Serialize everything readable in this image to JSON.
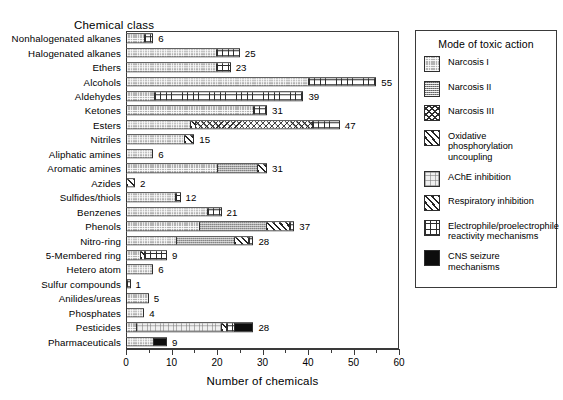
{
  "chart_data": {
    "type": "bar",
    "orientation": "horizontal",
    "stacked": true,
    "title": "",
    "ylabel": "Chemical class",
    "xlabel": "Number of chemicals",
    "xlim": [
      0,
      60
    ],
    "xticks": [
      0,
      10,
      20,
      30,
      40,
      50,
      60
    ],
    "xtick_minor_step": 5,
    "grid": false,
    "legend": {
      "position": "right",
      "title": "Mode of toxic action",
      "entries": [
        {
          "name": "Narcosis I",
          "pattern": "p-narc1"
        },
        {
          "name": "Narcosis II",
          "pattern": "p-narc2"
        },
        {
          "name": "Narcosis III",
          "pattern": "p-narc3"
        },
        {
          "name": "Oxidative phosphorylation uncoupling",
          "pattern": "p-oxphos"
        },
        {
          "name": "AChE inhibition",
          "pattern": "p-ache"
        },
        {
          "name": "Respiratory inhibition",
          "pattern": "p-resp"
        },
        {
          "name": "Electrophile/proelectrophile reactivity mechanisms",
          "pattern": "p-electro"
        },
        {
          "name": "CNS seizure mechanisms",
          "pattern": "p-cns"
        }
      ]
    },
    "series": [
      {
        "name": "Narcosis I",
        "pattern": "p-narc1"
      },
      {
        "name": "Narcosis II",
        "pattern": "p-narc2"
      },
      {
        "name": "Narcosis III",
        "pattern": "p-narc3"
      },
      {
        "name": "Oxidative phosphorylation uncoupling",
        "pattern": "p-oxphos"
      },
      {
        "name": "AChE inhibition",
        "pattern": "p-ache"
      },
      {
        "name": "Respiratory inhibition",
        "pattern": "p-resp"
      },
      {
        "name": "Electrophile/proelectrophile reactivity mechanisms",
        "pattern": "p-electro"
      },
      {
        "name": "CNS seizure mechanisms",
        "pattern": "p-cns"
      }
    ],
    "categories": [
      "Nonhalogenated alkanes",
      "Halogenated alkanes",
      "Ethers",
      "Alcohols",
      "Aldehydes",
      "Ketones",
      "Esters",
      "Nitriles",
      "Aliphatic amines",
      "Aromatic amines",
      "Azides",
      "Sulfides/thiols",
      "Benzenes",
      "Phenols",
      "Nitro-ring",
      "5-Membered ring",
      "Hetero atom",
      "Sulfur compounds",
      "Anilides/ureas",
      "Phosphates",
      "Pesticides",
      "Pharmaceuticals"
    ],
    "bars": [
      {
        "category": "Nonhalogenated alkanes",
        "total": 6,
        "segments": [
          {
            "pattern": "p-narc1",
            "value": 4
          },
          {
            "pattern": "p-electro",
            "value": 2
          }
        ]
      },
      {
        "category": "Halogenated alkanes",
        "total": 25,
        "segments": [
          {
            "pattern": "p-narc1",
            "value": 20
          },
          {
            "pattern": "p-electro",
            "value": 5
          }
        ]
      },
      {
        "category": "Ethers",
        "total": 23,
        "segments": [
          {
            "pattern": "p-narc1",
            "value": 20
          },
          {
            "pattern": "p-electro",
            "value": 3
          }
        ]
      },
      {
        "category": "Alcohols",
        "total": 55,
        "segments": [
          {
            "pattern": "p-narc1",
            "value": 40
          },
          {
            "pattern": "p-electro",
            "value": 15
          }
        ]
      },
      {
        "category": "Aldehydes",
        "total": 39,
        "segments": [
          {
            "pattern": "p-narc1",
            "value": 6
          },
          {
            "pattern": "p-electro",
            "value": 33
          }
        ]
      },
      {
        "category": "Ketones",
        "total": 31,
        "segments": [
          {
            "pattern": "p-narc1",
            "value": 28
          },
          {
            "pattern": "p-electro",
            "value": 3
          }
        ]
      },
      {
        "category": "Esters",
        "total": 47,
        "segments": [
          {
            "pattern": "p-narc1",
            "value": 14
          },
          {
            "pattern": "p-oxphos",
            "value": 1
          },
          {
            "pattern": "p-narc3",
            "value": 26
          },
          {
            "pattern": "p-electro",
            "value": 6
          }
        ]
      },
      {
        "category": "Nitriles",
        "total": 15,
        "segments": [
          {
            "pattern": "p-narc1",
            "value": 13
          },
          {
            "pattern": "p-resp",
            "value": 2
          }
        ]
      },
      {
        "category": "Aliphatic amines",
        "total": 6,
        "segments": [
          {
            "pattern": "p-narc1",
            "value": 6
          }
        ]
      },
      {
        "category": "Aromatic amines",
        "total": 31,
        "segments": [
          {
            "pattern": "p-narc1",
            "value": 20
          },
          {
            "pattern": "p-narc2",
            "value": 9
          },
          {
            "pattern": "p-resp",
            "value": 2
          }
        ]
      },
      {
        "category": "Azides",
        "total": 2,
        "segments": [
          {
            "pattern": "p-oxphos",
            "value": 2
          }
        ]
      },
      {
        "category": "Sulfides/thiols",
        "total": 12,
        "segments": [
          {
            "pattern": "p-narc1",
            "value": 11
          },
          {
            "pattern": "p-electro",
            "value": 1
          }
        ]
      },
      {
        "category": "Benzenes",
        "total": 21,
        "segments": [
          {
            "pattern": "p-narc1",
            "value": 18
          },
          {
            "pattern": "p-electro",
            "value": 3
          }
        ]
      },
      {
        "category": "Phenols",
        "total": 37,
        "segments": [
          {
            "pattern": "p-narc1",
            "value": 16
          },
          {
            "pattern": "p-narc2",
            "value": 15
          },
          {
            "pattern": "p-oxphos",
            "value": 5
          },
          {
            "pattern": "p-electro",
            "value": 1
          }
        ]
      },
      {
        "category": "Nitro-ring",
        "total": 28,
        "segments": [
          {
            "pattern": "p-narc1",
            "value": 11
          },
          {
            "pattern": "p-narc2",
            "value": 13
          },
          {
            "pattern": "p-oxphos",
            "value": 3
          },
          {
            "pattern": "p-electro",
            "value": 1
          }
        ]
      },
      {
        "category": "5-Membered ring",
        "total": 9,
        "segments": [
          {
            "pattern": "p-narc1",
            "value": 3
          },
          {
            "pattern": "p-oxphos",
            "value": 1
          },
          {
            "pattern": "p-electro",
            "value": 5
          }
        ]
      },
      {
        "category": "Hetero atom",
        "total": 6,
        "segments": [
          {
            "pattern": "p-narc1",
            "value": 6
          }
        ]
      },
      {
        "category": "Sulfur compounds",
        "total": 1,
        "segments": [
          {
            "pattern": "p-electro",
            "value": 1
          }
        ]
      },
      {
        "category": "Anilides/ureas",
        "total": 5,
        "segments": [
          {
            "pattern": "p-narc1",
            "value": 5
          }
        ]
      },
      {
        "category": "Phosphates",
        "total": 4,
        "segments": [
          {
            "pattern": "p-narc1",
            "value": 4
          }
        ]
      },
      {
        "category": "Pesticides",
        "total": 28,
        "segments": [
          {
            "pattern": "p-narc1",
            "value": 2
          },
          {
            "pattern": "p-ache",
            "value": 19
          },
          {
            "pattern": "p-oxphos",
            "value": 1
          },
          {
            "pattern": "p-electro",
            "value": 2
          },
          {
            "pattern": "p-cns",
            "value": 4
          }
        ]
      },
      {
        "category": "Pharmaceuticals",
        "total": 9,
        "segments": [
          {
            "pattern": "p-narc1",
            "value": 6
          },
          {
            "pattern": "p-cns",
            "value": 3
          }
        ]
      }
    ]
  }
}
